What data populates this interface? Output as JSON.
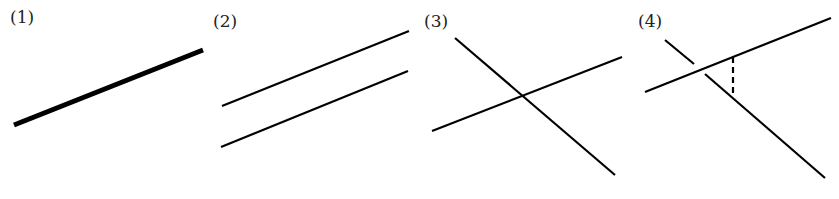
{
  "figure": {
    "stroke_color": "#000000",
    "panels": [
      {
        "id": 1,
        "label": "(1)",
        "meaning": "coincident lines",
        "label_pos": [
          10,
          9
        ],
        "lines": [
          {
            "x1": 14,
            "y1": 125,
            "x2": 203,
            "y2": 50,
            "width": 5,
            "dashed": false
          }
        ]
      },
      {
        "id": 2,
        "label": "(2)",
        "meaning": "parallel lines",
        "label_pos": [
          213,
          13
        ],
        "lines": [
          {
            "x1": 222,
            "y1": 106,
            "x2": 409,
            "y2": 31,
            "width": 2.2,
            "dashed": false
          },
          {
            "x1": 221,
            "y1": 147,
            "x2": 408,
            "y2": 71,
            "width": 2.2,
            "dashed": false
          }
        ]
      },
      {
        "id": 3,
        "label": "(3)",
        "meaning": "intersecting lines",
        "label_pos": [
          424,
          13
        ],
        "lines": [
          {
            "x1": 432,
            "y1": 131,
            "x2": 622,
            "y2": 57,
            "width": 2.2,
            "dashed": false
          },
          {
            "x1": 455,
            "y1": 38,
            "x2": 615,
            "y2": 175,
            "width": 2.2,
            "dashed": false
          }
        ]
      },
      {
        "id": 4,
        "label": "(4)",
        "meaning": "skew lines",
        "label_pos": [
          638,
          13
        ],
        "lines": [
          {
            "x1": 645,
            "y1": 92,
            "x2": 831,
            "y2": 18,
            "width": 2.2,
            "dashed": false
          },
          {
            "x1": 665,
            "y1": 40,
            "x2": 694,
            "y2": 64,
            "width": 2.2,
            "dashed": false
          },
          {
            "x1": 705,
            "y1": 74,
            "x2": 825,
            "y2": 178,
            "width": 2.2,
            "dashed": false
          },
          {
            "x1": 733,
            "y1": 57,
            "x2": 733,
            "y2": 97,
            "width": 2.2,
            "dashed": true
          }
        ]
      }
    ]
  }
}
